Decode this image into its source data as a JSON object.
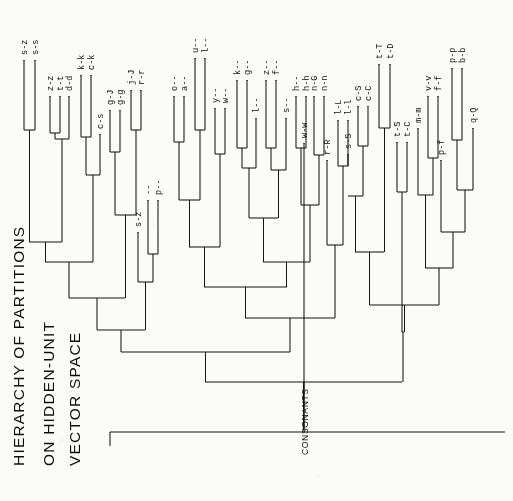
{
  "figure": {
    "title_lines": [
      "HIERARCHY OF PARTITIONS",
      "ON HIDDEN-UNIT",
      "VECTOR SPACE"
    ],
    "cluster_annotation": "CONSONANTS",
    "orientation": "rotated-90",
    "ink_color": "#111111",
    "background_color": "#fbfbfa"
  },
  "chart_data": {
    "type": "dendrogram",
    "title": "HIERARCHY OF PARTITIONS ON HIDDEN-UNIT VECTOR SPACE",
    "xlabel": "",
    "ylabel": "merge distance",
    "orientation": "leaves-at-top, root-at-bottom-right",
    "annotations": [
      "CONSONANTS"
    ],
    "leaf_count": 43,
    "leaves": [
      "s-z",
      "s-s",
      "z-z",
      "t-t",
      "d-d",
      "k-k",
      "c-k",
      "c-s",
      "g-J",
      "g-g",
      "j-J",
      "r-r",
      "s-z",
      "--",
      "p--",
      "o--",
      "a--",
      "u--",
      "l--",
      "y--",
      "w--",
      "k--",
      "g--",
      "l--",
      "z--",
      "f--",
      "s--",
      "h--",
      "h-h",
      "w-w",
      "n-G",
      "n-n",
      "r-R",
      "l-L",
      "l-l",
      "s-S",
      "c-S",
      "c-C",
      "t-T",
      "t-D",
      "t-S",
      "t-C",
      "m-m",
      "v-v",
      "f-f",
      "p-f",
      "p-p",
      "b-b",
      "q-Q"
    ],
    "leaf_labels_by_group": [
      {
        "group": "A1",
        "labels": [
          "s-z",
          "s-s"
        ]
      },
      {
        "group": "A2",
        "labels": [
          "z-z",
          "t-t",
          "d-d"
        ]
      },
      {
        "group": "A3",
        "labels": [
          "k-k",
          "c-k"
        ]
      },
      {
        "group": "A4",
        "labels": [
          "c-s"
        ]
      },
      {
        "group": "B1",
        "labels": [
          "g-J",
          "g-g"
        ]
      },
      {
        "group": "B2",
        "labels": [
          "j-J",
          "r-r"
        ]
      },
      {
        "group": "C1",
        "labels": [
          "s-z"
        ]
      },
      {
        "group": "C2",
        "labels": [
          "--",
          "p--"
        ]
      },
      {
        "group": "D1",
        "labels": [
          "o--",
          "a--"
        ]
      },
      {
        "group": "D2",
        "labels": [
          "u--",
          "l--"
        ]
      },
      {
        "group": "D3",
        "labels": [
          "y--",
          "w--"
        ]
      },
      {
        "group": "D4",
        "labels": [
          "k--",
          "g--"
        ]
      },
      {
        "group": "D5",
        "labels": [
          "l--",
          "z--",
          "f--"
        ]
      },
      {
        "group": "D6",
        "labels": [
          "s--",
          "h--",
          "h-h"
        ]
      },
      {
        "group": "E1",
        "labels": [
          "w-w",
          "n-G",
          "n-n"
        ]
      },
      {
        "group": "E2",
        "labels": [
          "r-R",
          "l-L",
          "l-l"
        ]
      },
      {
        "group": "F1",
        "labels": [
          "s-S",
          "c-S",
          "c-C"
        ]
      },
      {
        "group": "F2",
        "labels": [
          "t-T",
          "t-D"
        ]
      },
      {
        "group": "G1",
        "labels": [
          "t-S",
          "t-C"
        ]
      },
      {
        "group": "G2",
        "labels": [
          "m-m",
          "v-v",
          "f-f"
        ]
      },
      {
        "group": "G3",
        "labels": [
          "p-f",
          "p-p",
          "b-b"
        ]
      },
      {
        "group": "G4",
        "labels": [
          "q-Q"
        ]
      }
    ],
    "leaf_positions_px": [
      {
        "label": "s-z",
        "x": 24,
        "tip_y": 60
      },
      {
        "label": "s-s",
        "x": 35,
        "tip_y": 60
      },
      {
        "label": "z-z",
        "x": 50,
        "tip_y": 96
      },
      {
        "label": "t-t",
        "x": 60,
        "tip_y": 96
      },
      {
        "label": "d-d",
        "x": 69,
        "tip_y": 96
      },
      {
        "label": "k-k",
        "x": 81,
        "tip_y": 75
      },
      {
        "label": "c-k",
        "x": 91,
        "tip_y": 75
      },
      {
        "label": "c-s",
        "x": 100,
        "tip_y": 134
      },
      {
        "label": "g-J",
        "x": 110,
        "tip_y": 110
      },
      {
        "label": "g-g",
        "x": 120,
        "tip_y": 110
      },
      {
        "label": "j-J",
        "x": 131,
        "tip_y": 90
      },
      {
        "label": "r-r",
        "x": 141,
        "tip_y": 90
      },
      {
        "label": "s-z",
        "x": 138,
        "tip_y": 232
      },
      {
        "label": "--",
        "x": 148,
        "tip_y": 200
      },
      {
        "label": "p--",
        "x": 158,
        "tip_y": 200
      },
      {
        "label": "o--",
        "x": 174,
        "tip_y": 96
      },
      {
        "label": "a--",
        "x": 184,
        "tip_y": 96
      },
      {
        "label": "u--",
        "x": 195,
        "tip_y": 58
      },
      {
        "label": "l--",
        "x": 205,
        "tip_y": 58
      },
      {
        "label": "y--",
        "x": 215,
        "tip_y": 108
      },
      {
        "label": "w--",
        "x": 225,
        "tip_y": 108
      },
      {
        "label": "k--",
        "x": 237,
        "tip_y": 80
      },
      {
        "label": "g--",
        "x": 247,
        "tip_y": 80
      },
      {
        "label": "l--",
        "x": 256,
        "tip_y": 118
      },
      {
        "label": "z--",
        "x": 266,
        "tip_y": 80
      },
      {
        "label": "f--",
        "x": 276,
        "tip_y": 80
      },
      {
        "label": "s--",
        "x": 286,
        "tip_y": 118
      },
      {
        "label": "h--",
        "x": 296,
        "tip_y": 96
      },
      {
        "label": "h-h",
        "x": 306,
        "tip_y": 96
      },
      {
        "label": "w-w",
        "x": 304,
        "tip_y": 143
      },
      {
        "label": "n-G",
        "x": 314,
        "tip_y": 96
      },
      {
        "label": "n-n",
        "x": 324,
        "tip_y": 96
      },
      {
        "label": "r-R",
        "x": 327,
        "tip_y": 160
      },
      {
        "label": "l-L",
        "x": 338,
        "tip_y": 120
      },
      {
        "label": "l-l",
        "x": 348,
        "tip_y": 120
      },
      {
        "label": "s-S",
        "x": 348,
        "tip_y": 154
      },
      {
        "label": "c-S",
        "x": 358,
        "tip_y": 106
      },
      {
        "label": "c-C",
        "x": 368,
        "tip_y": 106
      },
      {
        "label": "t-T",
        "x": 379,
        "tip_y": 64
      },
      {
        "label": "t-D",
        "x": 390,
        "tip_y": 64
      },
      {
        "label": "t-S",
        "x": 397,
        "tip_y": 142
      },
      {
        "label": "t-C",
        "x": 407,
        "tip_y": 142
      },
      {
        "label": "m-m",
        "x": 418,
        "tip_y": 128
      },
      {
        "label": "v-v",
        "x": 428,
        "tip_y": 96
      },
      {
        "label": "f-f",
        "x": 438,
        "tip_y": 96
      },
      {
        "label": "p-f",
        "x": 441,
        "tip_y": 160
      },
      {
        "label": "p-p",
        "x": 452,
        "tip_y": 68
      },
      {
        "label": "b-b",
        "x": 462,
        "tip_y": 68
      },
      {
        "label": "q-Q",
        "x": 473,
        "tip_y": 128
      }
    ],
    "merges_px": [
      {
        "id": "m1",
        "a": 24,
        "b": 35,
        "y": 130,
        "note": "s-z + s-s"
      },
      {
        "id": "m2",
        "a": 50,
        "b": 60,
        "y": 133,
        "note": "z-z + t-t"
      },
      {
        "id": "m3",
        "a": 55,
        "b": 69,
        "y": 139,
        "note": "+ d-d"
      },
      {
        "id": "m4",
        "a": 81,
        "b": 91,
        "y": 137,
        "note": "k-k + c-k"
      },
      {
        "id": "m5",
        "a": 86,
        "b": 100,
        "y": 175,
        "note": "+ c-s"
      },
      {
        "id": "m6",
        "a": 110,
        "b": 120,
        "y": 152,
        "note": "g-J + g-g"
      },
      {
        "id": "m7",
        "a": 131,
        "b": 141,
        "y": 130,
        "note": "j-J + r-r"
      },
      {
        "id": "m8",
        "a": 115,
        "b": 136,
        "y": 215,
        "note": "gg + jr"
      },
      {
        "id": "m9",
        "a": 148,
        "b": 158,
        "y": 254,
        "note": "-- + p--"
      },
      {
        "id": "m10",
        "a": 138,
        "b": 153,
        "y": 282,
        "note": "s-z + (--,p--)"
      },
      {
        "id": "m11",
        "a": 29,
        "b": 62,
        "y": 242,
        "note": "m1 + m3"
      },
      {
        "id": "m12",
        "a": 45,
        "b": 93,
        "y": 262,
        "note": "+ m5"
      },
      {
        "id": "m13",
        "a": 69,
        "b": 125,
        "y": 298,
        "note": "+ m8"
      },
      {
        "id": "m14",
        "a": 97,
        "b": 145,
        "y": 330,
        "note": "+ m10"
      },
      {
        "id": "m15",
        "a": 174,
        "b": 184,
        "y": 142,
        "note": "o-- + a--"
      },
      {
        "id": "m16",
        "a": 195,
        "b": 205,
        "y": 130,
        "note": "u-- + l--"
      },
      {
        "id": "m17",
        "a": 215,
        "b": 225,
        "y": 154,
        "note": "y-- + w--"
      },
      {
        "id": "m18",
        "a": 179,
        "b": 200,
        "y": 200,
        "note": "oa + ul"
      },
      {
        "id": "m19",
        "a": 237,
        "b": 247,
        "y": 148,
        "note": "k-- + g--"
      },
      {
        "id": "m20",
        "a": 266,
        "b": 276,
        "y": 148,
        "note": "z-- + f--"
      },
      {
        "id": "m21",
        "a": 242,
        "b": 256,
        "y": 168,
        "note": "kg + l--"
      },
      {
        "id": "m22",
        "a": 271,
        "b": 286,
        "y": 170,
        "note": "zf + s--"
      },
      {
        "id": "m23",
        "a": 249,
        "b": 278,
        "y": 218,
        "note": "kgl + zfs"
      },
      {
        "id": "m24",
        "a": 189,
        "b": 220,
        "y": 247,
        "note": "oaul + y/w"
      },
      {
        "id": "m25",
        "a": 296,
        "b": 306,
        "y": 148,
        "note": "h-- + h-h"
      },
      {
        "id": "m26",
        "a": 314,
        "b": 324,
        "y": 155,
        "note": "n-G + n-n"
      },
      {
        "id": "m27",
        "a": 301,
        "b": 319,
        "y": 205,
        "note": "hh + nn"
      },
      {
        "id": "m28",
        "a": 263,
        "b": 310,
        "y": 262,
        "note": "mid merge"
      },
      {
        "id": "m29",
        "a": 204,
        "b": 287,
        "y": 287,
        "note": "big vowel-ish merge"
      },
      {
        "id": "m30",
        "a": 338,
        "b": 348,
        "y": 166,
        "note": "l-L + l-l"
      },
      {
        "id": "m31",
        "a": 327,
        "b": 343,
        "y": 245,
        "note": "r-R + lL/ll"
      },
      {
        "id": "m32",
        "a": 245,
        "b": 335,
        "y": 318,
        "note": "merge to left block"
      },
      {
        "id": "m33",
        "a": 121,
        "b": 290,
        "y": 352,
        "note": "left super-merge"
      },
      {
        "id": "m34",
        "a": 358,
        "b": 368,
        "y": 146,
        "note": "c-S + c-C"
      },
      {
        "id": "m35",
        "a": 363,
        "b": 348,
        "y": 196,
        "note": "cScC + s-S"
      },
      {
        "id": "m36",
        "a": 379,
        "b": 390,
        "y": 128,
        "note": "t-T + t-D"
      },
      {
        "id": "m37",
        "a": 355,
        "b": 384,
        "y": 252,
        "note": "sScSCC + tTtD"
      },
      {
        "id": "m38",
        "a": 397,
        "b": 407,
        "y": 192,
        "note": "t-S + t-C"
      },
      {
        "id": "m39",
        "a": 428,
        "b": 438,
        "y": 158,
        "note": "v-v + f-f"
      },
      {
        "id": "m40",
        "a": 418,
        "b": 433,
        "y": 195,
        "note": "m-m + vvff"
      },
      {
        "id": "m41",
        "a": 452,
        "b": 462,
        "y": 140,
        "note": "p-p + b-b"
      },
      {
        "id": "m42",
        "a": 457,
        "b": 473,
        "y": 190,
        "note": "ppbb + q-Q"
      },
      {
        "id": "m43",
        "a": 441,
        "b": 465,
        "y": 232,
        "note": "p-f + ppbbqQ"
      },
      {
        "id": "m44",
        "a": 425,
        "b": 453,
        "y": 268,
        "note": "mvf + pf-block"
      },
      {
        "id": "m45",
        "a": 370,
        "b": 439,
        "y": 305,
        "note": "right super-merge"
      },
      {
        "id": "m46",
        "a": 402,
        "b": 404,
        "y": 332,
        "note": "+ tStC"
      },
      {
        "id": "m47",
        "a": 205,
        "b": 402,
        "y": 382,
        "note": "CONSONANTS split"
      },
      {
        "id": "m48",
        "a": 304,
        "b": 304,
        "y": 430,
        "note": "root"
      }
    ]
  }
}
